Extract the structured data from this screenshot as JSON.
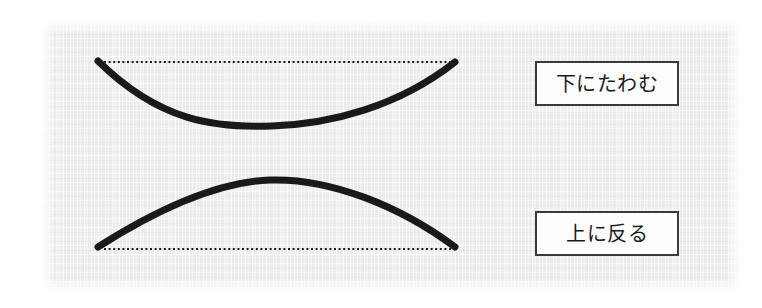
{
  "figure": {
    "background_color": "#ededed",
    "stroke_color": "#1a1a1a",
    "panel": {
      "x": 42,
      "y": 21,
      "width": 699,
      "height": 270
    },
    "curves": [
      {
        "name": "sagging-curve",
        "shape": "concave-up",
        "start": {
          "x": 98,
          "y": 61
        },
        "end": {
          "x": 455,
          "y": 62
        },
        "extremum": {
          "x": 272,
          "y": 125
        },
        "stroke_width": 7,
        "reference_line": {
          "name": "sag-reference-line",
          "style": "dotted",
          "from": {
            "x": 104,
            "y": 62
          },
          "to": {
            "x": 452,
            "y": 62
          }
        }
      },
      {
        "name": "warping-curve",
        "shape": "convex-up",
        "start": {
          "x": 98,
          "y": 247
        },
        "end": {
          "x": 455,
          "y": 247
        },
        "extremum": {
          "x": 270,
          "y": 180
        },
        "stroke_width": 7,
        "reference_line": {
          "name": "warp-reference-line",
          "style": "dotted",
          "from": {
            "x": 104,
            "y": 249
          },
          "to": {
            "x": 452,
            "y": 249
          }
        }
      }
    ]
  },
  "labels": {
    "sag": "下にたわむ",
    "warp": "上に反る"
  }
}
